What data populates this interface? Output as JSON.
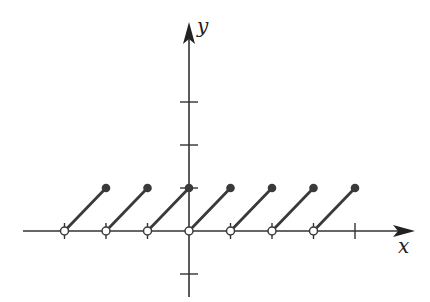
{
  "chart_data": {
    "type": "line",
    "title": "",
    "xlabel": "x",
    "ylabel": "y",
    "xlim": [
      -3,
      4
    ],
    "ylim": [
      -1,
      3
    ],
    "x_ticks": [
      -3,
      -2,
      -1,
      0,
      1,
      2,
      3,
      4
    ],
    "y_ticks": [
      -1,
      1,
      2,
      3
    ],
    "grid": false,
    "legend": null,
    "segments": [
      {
        "start": [
          -3,
          0
        ],
        "end": [
          -2,
          1
        ],
        "start_open": true,
        "end_closed": true
      },
      {
        "start": [
          -2,
          0
        ],
        "end": [
          -1,
          1
        ],
        "start_open": true,
        "end_closed": true
      },
      {
        "start": [
          -1,
          0
        ],
        "end": [
          0,
          1
        ],
        "start_open": true,
        "end_closed": true
      },
      {
        "start": [
          0,
          0
        ],
        "end": [
          1,
          1
        ],
        "start_open": true,
        "end_closed": true
      },
      {
        "start": [
          1,
          0
        ],
        "end": [
          2,
          1
        ],
        "start_open": true,
        "end_closed": true
      },
      {
        "start": [
          2,
          0
        ],
        "end": [
          3,
          1
        ],
        "start_open": true,
        "end_closed": true
      },
      {
        "start": [
          3,
          0
        ],
        "end": [
          4,
          1
        ],
        "start_open": true,
        "end_closed": true
      }
    ],
    "colors": {
      "line": "#3a3a3a",
      "axis": "#333333",
      "open_fill": "#ffffff"
    }
  },
  "labels": {
    "x": "x",
    "y": "y"
  },
  "layout": {
    "origin_px": [
      189,
      231
    ],
    "unit_px_x": 41.5,
    "unit_px_y": 43,
    "x_axis_px": [
      23,
      415
    ],
    "y_axis_px": [
      22,
      297
    ]
  }
}
